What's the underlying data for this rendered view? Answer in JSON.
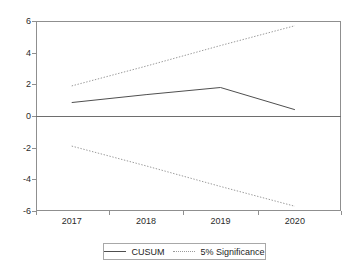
{
  "chart_data": {
    "type": "line",
    "title": "",
    "subtitle": "",
    "xlabel": "",
    "ylabel": "",
    "x": [
      2017,
      2018,
      2019,
      2020
    ],
    "xlim": [
      2016.52,
      2020.62
    ],
    "ylim": [
      -6,
      6
    ],
    "yticks": [
      6,
      4,
      2,
      0,
      -2,
      -4,
      -6
    ],
    "ytick_labels": [
      "6",
      "4",
      "2",
      "0",
      "-2",
      "-4",
      "-6"
    ],
    "xtick_labels": [
      "2017",
      "2018",
      "2019",
      "2020"
    ],
    "grid": false,
    "zero_line": true,
    "legend_position": "bottom-center",
    "series": [
      {
        "name": "CUSUM",
        "style": "solid",
        "color": "#4f4f4f",
        "values": [
          0.85,
          1.35,
          1.8,
          0.4
        ]
      },
      {
        "name": "5% Significance",
        "style": "dotted",
        "color": "#9a9a9a",
        "values": [
          1.9,
          3.15,
          4.45,
          5.7
        ]
      },
      {
        "name": "5% Significance",
        "style": "dotted",
        "color": "#9a9a9a",
        "values": [
          -1.9,
          -3.15,
          -4.45,
          -5.7
        ]
      }
    ],
    "legend": [
      {
        "label": "CUSUM",
        "style": "solid",
        "color": "#4f4f4f"
      },
      {
        "label": "5% Significance",
        "style": "dotted",
        "color": "#9a9a9a"
      }
    ]
  },
  "axes": {
    "frame_color": "#8f8f8f",
    "text_color": "#2b2b2b"
  }
}
